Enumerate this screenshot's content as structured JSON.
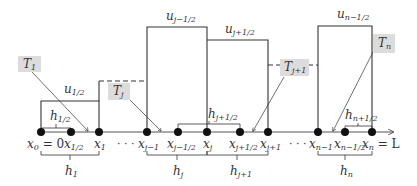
{
  "diagram": {
    "type": "piecewise-constant finite volume grid",
    "axis": {
      "label_end": "L",
      "arrow": true
    },
    "nodes": [
      {
        "id": "x0",
        "label": "x",
        "sub": "0",
        "suffix": " = 0",
        "x": 41
      },
      {
        "id": "x1/2",
        "label": "x",
        "sub": "1/2",
        "suffix": "",
        "x": 71
      },
      {
        "id": "x1",
        "label": "x",
        "sub": "1",
        "suffix": "",
        "x": 99
      },
      {
        "id": "xj-1",
        "label": "x",
        "sub": "j−1",
        "suffix": "",
        "x": 147
      },
      {
        "id": "xj-1/2",
        "label": "x",
        "sub": "j−1/2",
        "suffix": "",
        "x": 178
      },
      {
        "id": "xj",
        "label": "x",
        "sub": "j",
        "suffix": "",
        "x": 207
      },
      {
        "id": "xj+1/2",
        "label": "x",
        "sub": "j+1/2",
        "suffix": "",
        "x": 240
      },
      {
        "id": "xj+1",
        "label": "x",
        "sub": "j+1",
        "suffix": "",
        "x": 268
      },
      {
        "id": "xn-1",
        "label": "x",
        "sub": "n−1",
        "suffix": "",
        "x": 318
      },
      {
        "id": "xn-1/2",
        "label": "x",
        "sub": "n−1/2",
        "suffix": "",
        "x": 345
      },
      {
        "id": "xn",
        "label": "x",
        "sub": "n",
        "suffix": " = L",
        "x": 372
      }
    ],
    "ellipses": [
      "· · ·",
      "· · ·"
    ],
    "cell_values": [
      {
        "label": "u",
        "sub": "1/2"
      },
      {
        "label": "u",
        "sub": "j−1/2"
      },
      {
        "label": "u",
        "sub": "j+1/2"
      },
      {
        "label": "u",
        "sub": "n−1/2"
      }
    ],
    "cell_widths": [
      {
        "label": "h",
        "sub": "1"
      },
      {
        "label": "h",
        "sub": "j"
      },
      {
        "label": "h",
        "sub": "j+1"
      },
      {
        "label": "h",
        "sub": "n"
      }
    ],
    "half_widths": [
      {
        "label": "h",
        "sub": "1/2"
      },
      {
        "label": "h",
        "sub": "j+1/2"
      },
      {
        "label": "h",
        "sub": "n+1/2"
      }
    ],
    "callouts": [
      {
        "label": "T",
        "sub": "1"
      },
      {
        "label": "T",
        "sub": "j"
      },
      {
        "label": "T",
        "sub": "j+1"
      },
      {
        "label": "T",
        "sub": "n"
      }
    ],
    "colors": {
      "line": "#333333",
      "callout_bg": "#dcdcdc",
      "background": "#ffffff"
    }
  }
}
